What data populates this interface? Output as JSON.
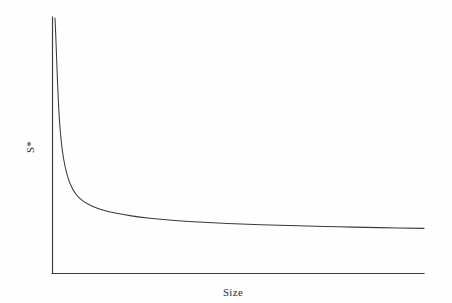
{
  "figure": {
    "background_color": "#fefefe",
    "line_color": "#3a3a3a",
    "axis_color": "#3d3d3d"
  },
  "axes": {
    "y_label": "S*",
    "x_label": "Size"
  },
  "chart_data": {
    "type": "line",
    "title": "",
    "subtitle": "",
    "xlabel": "Size",
    "ylabel": "S*",
    "legend": [],
    "legend_position": "none",
    "grid": false,
    "xlim": [
      0,
      100
    ],
    "ylim": [
      0,
      100
    ],
    "x_tick_labels": [],
    "y_tick_labels": [],
    "annotations": [],
    "series": [
      {
        "name": "S*",
        "x": [
          0.4,
          0.6,
          0.9,
          1.2,
          1.6,
          2.1,
          2.7,
          3.5,
          4.5,
          6.0,
          8.0,
          10.5,
          13.5,
          17.0,
          21.0,
          26.0,
          32.0,
          39.0,
          47.0,
          56.0,
          66.0,
          77.0,
          88.0,
          100.0
        ],
        "y": [
          100.0,
          93.5,
          82.0,
          71.0,
          60.0,
          51.5,
          45.0,
          39.5,
          35.0,
          31.0,
          28.2,
          26.2,
          24.6,
          23.4,
          22.4,
          21.5,
          20.7,
          20.0,
          19.4,
          18.9,
          18.5,
          18.1,
          17.8,
          17.5
        ]
      }
    ]
  }
}
